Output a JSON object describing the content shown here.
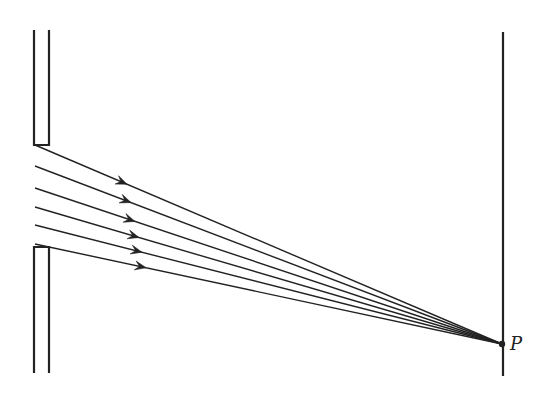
{
  "diagram": {
    "point_label": "P",
    "colors": {
      "stroke": "#222222",
      "background": "#ffffff"
    },
    "slit": {
      "upper_wall": {
        "x1": 34,
        "x2": 49,
        "y_top": 30,
        "y_bottom": 145
      },
      "lower_wall": {
        "x1": 34,
        "x2": 49,
        "y_top": 247,
        "y_bottom": 373
      }
    },
    "screen": {
      "x": 503,
      "y_top": 32,
      "y_bottom": 376
    },
    "point_P": {
      "x": 502,
      "y": 344
    },
    "rays": [
      {
        "x0": 35,
        "y0": 145,
        "arrow_x": 127
      },
      {
        "x0": 35,
        "y0": 166,
        "arrow_x": 131
      },
      {
        "x0": 35,
        "y0": 188,
        "arrow_x": 135
      },
      {
        "x0": 35,
        "y0": 207,
        "arrow_x": 139
      },
      {
        "x0": 35,
        "y0": 225,
        "arrow_x": 142
      },
      {
        "x0": 35,
        "y0": 244,
        "arrow_x": 146
      }
    ]
  }
}
